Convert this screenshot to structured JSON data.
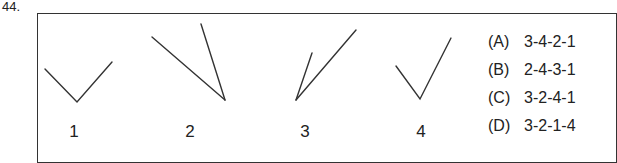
{
  "question": {
    "number": "44.",
    "figures": [
      {
        "label": "1",
        "shape": "v-open-upward-symmetric"
      },
      {
        "label": "2",
        "shape": "two-lines-converging-bottom-right"
      },
      {
        "label": "3",
        "shape": "two-lines-converging-bottom-left"
      },
      {
        "label": "4",
        "shape": "checkmark"
      }
    ],
    "options": [
      {
        "letter": "(A)",
        "text": "3-4-2-1"
      },
      {
        "letter": "(B)",
        "text": "2-4-3-1"
      },
      {
        "letter": "(C)",
        "text": "3-2-4-1"
      },
      {
        "letter": "(D)",
        "text": "3-2-1-4"
      }
    ]
  }
}
